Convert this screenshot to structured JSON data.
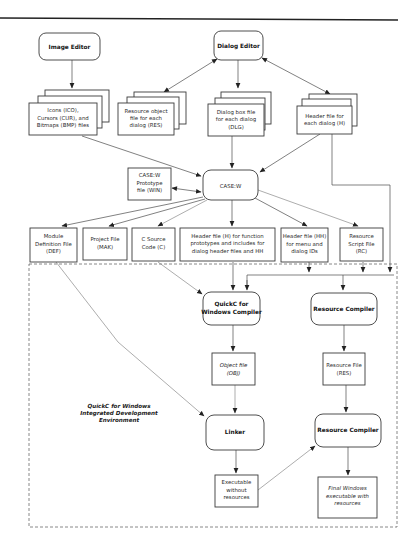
{
  "diagram": {
    "nodes": {
      "image_editor": {
        "label": "Image Editor"
      },
      "dialog_editor": {
        "label": "Dialog Editor"
      },
      "icons_files": {
        "lines": [
          "Icons (ICO),",
          "Cursors (CUR), and",
          "Bitmaps (BMP) files"
        ]
      },
      "resource_object": {
        "lines": [
          "Resource object",
          "file for each",
          "dialog (RES)"
        ]
      },
      "dialog_box_file": {
        "lines": [
          "Dialog box file",
          "for each dialog",
          "(DLG)"
        ]
      },
      "header_file_dialog": {
        "lines": [
          "Header file for",
          "each dialog (H)"
        ]
      },
      "casew": {
        "label": "CASE:W"
      },
      "casew_prototype": {
        "lines": [
          "CASE:W",
          "Prototype",
          "file (WIN)"
        ]
      },
      "module_def": {
        "lines": [
          "Module",
          "Definition File",
          "(DEF)"
        ]
      },
      "project_file": {
        "lines": [
          "Project File",
          "(MAK)"
        ]
      },
      "c_source": {
        "lines": [
          "C Source",
          "Code (C)"
        ]
      },
      "header_func": {
        "lines": [
          "Header file (H) for function",
          "prototypes and includes for",
          "dialog header files and HH"
        ]
      },
      "header_hh": {
        "lines": [
          "Header file (HH)",
          "for menu and",
          "dialog IDs"
        ]
      },
      "resource_script": {
        "lines": [
          "Resource",
          "Script File",
          "(RC)"
        ]
      },
      "quickc_compiler": {
        "lines": [
          "QuickC for",
          "Windows Compiler"
        ]
      },
      "resource_compiler_1": {
        "label": "Resource Compiler"
      },
      "object_file": {
        "lines": [
          "Object file",
          "(OBJ)"
        ]
      },
      "resource_file": {
        "lines": [
          "Resource File",
          "(RES)"
        ]
      },
      "linker": {
        "label": "Linker"
      },
      "resource_compiler_2": {
        "label": "Resource Compiler"
      },
      "exe_without": {
        "lines": [
          "Executable",
          "without",
          "resources"
        ]
      },
      "final_exe": {
        "lines": [
          "Final Windows",
          "executable with",
          "resources"
        ]
      }
    },
    "ide_region": {
      "lines": [
        "QuickC for Windows",
        "Integrated Development",
        "Environment"
      ]
    }
  }
}
